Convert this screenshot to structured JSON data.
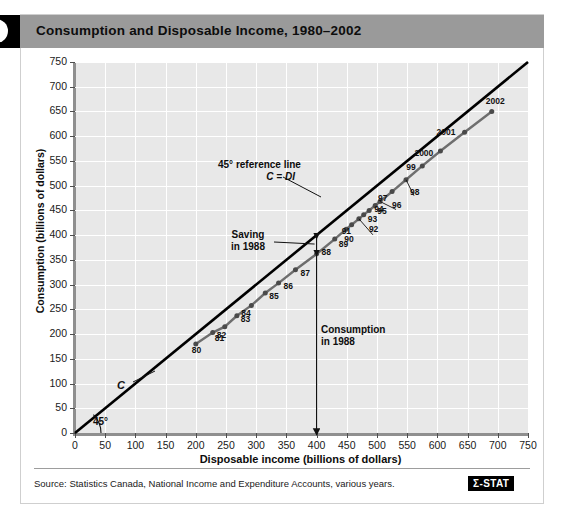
{
  "figure": {
    "tab_icon": "figure-number-tab",
    "title": "Consumption and Disposable Income, 1980–2002"
  },
  "footer": {
    "source": "Source: Statistics Canada, National Income and Expenditure Accounts, various years.",
    "logo": "Σ-STAT"
  },
  "colors": {
    "header_band": "#9a9a9a",
    "plot_background": "#e8e8e8",
    "gridline": "#ffffff",
    "reference_line": "#000000",
    "consumption_line": "#6e6e6e",
    "point": "#4a4a4a",
    "axis": "#8f8f8f"
  },
  "annotations": {
    "reference_line_1": "45° reference line",
    "reference_line_2": "C = DI",
    "saving_1": "Saving",
    "saving_2": "in 1988",
    "consumption_1": "Consumption",
    "consumption_2": "in 1988",
    "c_curve_label": "C",
    "angle_label": "45°"
  },
  "chart_data": {
    "type": "scatter",
    "title": "Consumption and Disposable Income, 1980–2002",
    "xlabel": "Disposable income (billions of dollars)",
    "ylabel": "Consumption (billions of dollars)",
    "xlim": [
      0,
      750
    ],
    "ylim": [
      0,
      750
    ],
    "xticks": [
      0,
      50,
      100,
      150,
      200,
      250,
      300,
      350,
      400,
      450,
      500,
      550,
      600,
      650,
      700,
      750
    ],
    "yticks": [
      0,
      50,
      100,
      150,
      200,
      250,
      300,
      350,
      400,
      450,
      500,
      550,
      600,
      650,
      700,
      750
    ],
    "grid": true,
    "legend": "none",
    "series": [
      {
        "name": "C (consumption function)",
        "type": "scatter+line",
        "color": "#6e6e6e",
        "points": [
          {
            "label": "80",
            "x": 200,
            "y": 180
          },
          {
            "label": "81",
            "x": 228,
            "y": 203
          },
          {
            "label": "82",
            "x": 248,
            "y": 215
          },
          {
            "label": "83",
            "x": 268,
            "y": 237
          },
          {
            "label": "84",
            "x": 292,
            "y": 258
          },
          {
            "label": "85",
            "x": 315,
            "y": 283
          },
          {
            "label": "86",
            "x": 337,
            "y": 303
          },
          {
            "label": "87",
            "x": 365,
            "y": 330
          },
          {
            "label": "88",
            "x": 400,
            "y": 362
          },
          {
            "label": "89",
            "x": 430,
            "y": 392
          },
          {
            "label": "90",
            "x": 449,
            "y": 412
          },
          {
            "label": "91",
            "x": 458,
            "y": 421
          },
          {
            "label": "92",
            "x": 470,
            "y": 433
          },
          {
            "label": "93",
            "x": 478,
            "y": 441
          },
          {
            "label": "94",
            "x": 487,
            "y": 450
          },
          {
            "label": "95",
            "x": 497,
            "y": 460
          },
          {
            "label": "96",
            "x": 505,
            "y": 468
          },
          {
            "label": "97",
            "x": 525,
            "y": 488
          },
          {
            "label": "98",
            "x": 548,
            "y": 512
          },
          {
            "label": "99",
            "x": 575,
            "y": 540
          },
          {
            "label": "2000",
            "x": 605,
            "y": 570
          },
          {
            "label": "2001",
            "x": 645,
            "y": 608
          },
          {
            "label": "2002",
            "x": 690,
            "y": 650
          }
        ]
      },
      {
        "name": "45° reference line (C = DI)",
        "type": "line",
        "color": "#000000",
        "x": [
          0,
          750
        ],
        "y": [
          0,
          750
        ]
      }
    ],
    "markers": {
      "consumption_1988": {
        "x": 400,
        "y": 362,
        "note": "vertical arrow from C point at DI=400 down to axis"
      },
      "saving_1988": {
        "x": 400,
        "from_y": 362,
        "to_y": 400,
        "note": "double-headed arrow between C line and 45° line"
      }
    }
  }
}
